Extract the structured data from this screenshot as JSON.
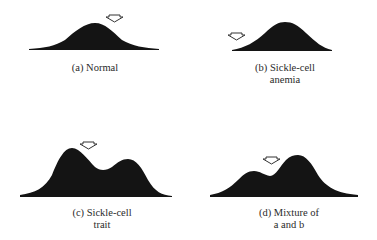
{
  "figure": {
    "panels": [
      {
        "id": "a",
        "caption_line1": "(a) Normal",
        "caption_line2": "",
        "shape": "unimodal",
        "arrow": "points down at right shoulder of peak"
      },
      {
        "id": "b",
        "caption_line1": "(b) Sickle-cell",
        "caption_line2": "anemia",
        "shape": "unimodal",
        "arrow": "points down at far left of curve"
      },
      {
        "id": "c",
        "caption_line1": "(c) Sickle-cell",
        "caption_line2": "trait",
        "shape": "bimodal, taller left peak",
        "arrow": "points down at left peak"
      },
      {
        "id": "d",
        "caption_line1": "(d) Mixture of",
        "caption_line2": "a and b",
        "shape": "bimodal, taller right peak",
        "arrow": "points down at dip between peaks"
      }
    ],
    "colors": {
      "fill": "#141414",
      "arrow_stroke": "#333333",
      "background": "#ffffff"
    },
    "icons": {
      "marker": "down-arrow-outline-icon"
    }
  }
}
